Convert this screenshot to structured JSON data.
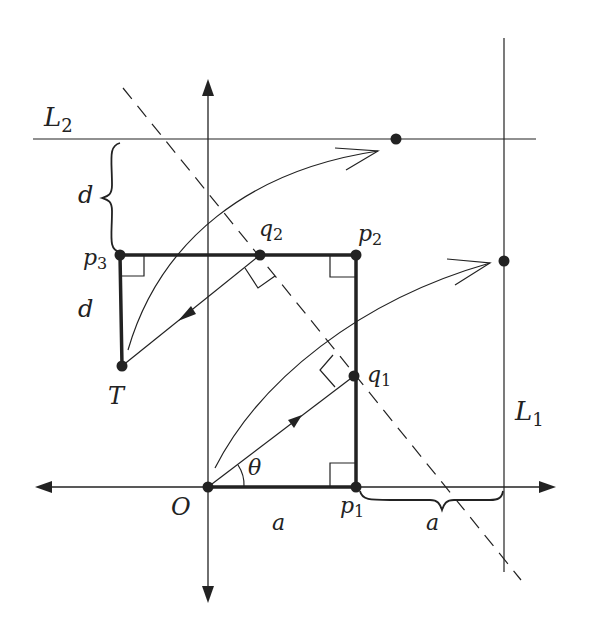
{
  "diagram": {
    "type": "geometry",
    "labels": {
      "L2": {
        "main": "L",
        "sub": "2"
      },
      "L1": {
        "main": "L",
        "sub": "1"
      },
      "p1": {
        "main": "p",
        "sub": "1"
      },
      "p2": {
        "main": "p",
        "sub": "2"
      },
      "p3": {
        "main": "p",
        "sub": "3"
      },
      "q1": {
        "main": "q",
        "sub": "1"
      },
      "q2": {
        "main": "q",
        "sub": "2"
      },
      "O": "O",
      "T": "T",
      "theta": "θ",
      "a_bottom": "a",
      "a_right": "a",
      "d_upper": "d",
      "d_lower": "d"
    },
    "points": {
      "O": [
        208,
        487
      ],
      "p1": [
        356,
        487
      ],
      "p2": [
        356,
        255
      ],
      "p3": [
        120,
        255
      ],
      "q1": [
        354,
        376
      ],
      "q2": [
        260,
        255
      ],
      "T": [
        122,
        366
      ],
      "L2_dot": [
        396,
        139
      ],
      "L1_dot": [
        504,
        261
      ]
    },
    "colors": {
      "ink": "#222222",
      "background": "#ffffff"
    }
  }
}
